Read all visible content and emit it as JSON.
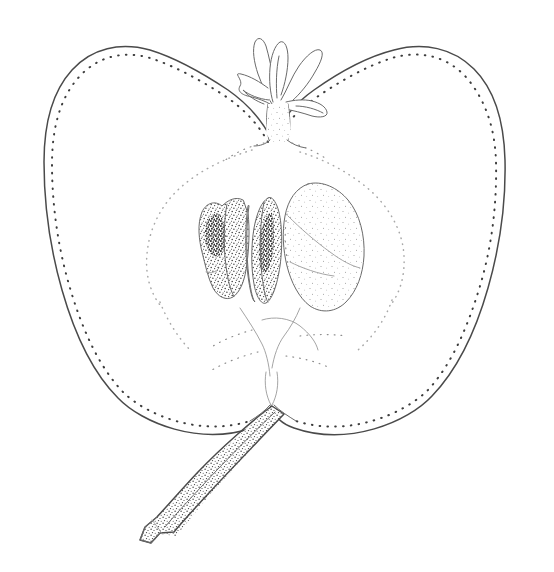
{
  "image": {
    "title": "Botanical line illustration of a pome fruit in longitudinal section",
    "subject": "fruit-longitudinal-section",
    "medium": "pen-and-ink stipple drawing",
    "background_color": "#ffffff",
    "ink_color": "#4a4a4a",
    "stipple_color": "#3d3d3d",
    "faint_line_color": "#a8a8a8",
    "canvas": {
      "width": 554,
      "height": 572
    }
  },
  "parts": [
    {
      "id": "fruit-body",
      "label": "Fruit body (longitudinal section)",
      "description": "Broad heart-shaped pome outline with a shallow apical depression and a basal notch",
      "bounds": {
        "left": 45,
        "top": 42,
        "right": 506,
        "bottom": 465
      }
    },
    {
      "id": "skin-stipple",
      "label": "Skin stipple border",
      "description": "Row of fine dots paralleling the inside of the fruit outline indicating the skin"
    },
    {
      "id": "calyx",
      "label": "Calyx with persistent sepals",
      "description": "Dried five-lobed calyx and short tube at the apex of the fruit",
      "bounds": {
        "left": 243,
        "top": 30,
        "right": 330,
        "bottom": 140
      }
    },
    {
      "id": "core-line-left",
      "label": "Left core outline",
      "description": "Faint dotted arc sweeping from the calyx down the left of the carpel cavity"
    },
    {
      "id": "core-line-right",
      "label": "Right core outline",
      "description": "Faint dotted arc mirroring the left side of the carpel cavity"
    },
    {
      "id": "seed-left",
      "label": "Left seed",
      "description": "Heavily stippled seed shown in section with a dark chalaza shadow",
      "bounds": {
        "left": 198,
        "top": 198,
        "right": 258,
        "bottom": 300
      }
    },
    {
      "id": "seed-right",
      "label": "Right seed",
      "description": "Narrow stippled seed in section with dark inner shading",
      "bounds": {
        "left": 248,
        "top": 196,
        "right": 285,
        "bottom": 305
      }
    },
    {
      "id": "endocarp-lobe",
      "label": "Fleshy endocarp lobe",
      "description": "Large pale rounded mass to the right of the seeds with sparse stipple",
      "bounds": {
        "left": 282,
        "top": 182,
        "right": 366,
        "bottom": 312
      }
    },
    {
      "id": "vascular-strands",
      "label": "Vascular strands",
      "description": "Faint broken lines radiating from the core toward the stem base"
    },
    {
      "id": "stem",
      "label": "Stem (peduncle)",
      "description": "Stout stippled stalk running from the basal notch down to a cut, blunt end at lower left",
      "bounds": {
        "left": 137,
        "top": 400,
        "right": 290,
        "bottom": 548
      }
    }
  ],
  "stipple": {
    "skin_dot_count": 230,
    "core_dot_count": 90,
    "seed_texture": "dense random stipple",
    "lobe_texture": "sparse random stipple"
  }
}
